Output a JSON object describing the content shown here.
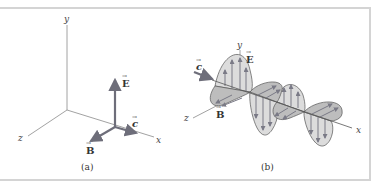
{
  "figure": {
    "panel_a": {
      "caption": "(a)",
      "axes": {
        "x": "x",
        "y": "y",
        "z": "z"
      },
      "vectors": {
        "E": "E",
        "B": "B",
        "c": "c"
      }
    },
    "panel_b": {
      "caption": "(b)",
      "axes": {
        "x": "x",
        "y": "y",
        "z": "z"
      },
      "vectors": {
        "E": "E",
        "B": "B",
        "c": "c"
      }
    }
  },
  "colors": {
    "vector": "#6e6e7a",
    "axis": "#8a8a8a",
    "wave_fill_e": "#d9d9d9",
    "wave_fill_b": "#bdbdbd",
    "frame": "#d4d4d4"
  }
}
